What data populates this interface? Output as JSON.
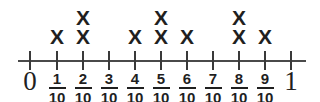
{
  "chart_data": {
    "type": "line-plot",
    "title": "",
    "xlabel": "",
    "ylabel": "",
    "axis": {
      "start_label": "0",
      "end_label": "1",
      "denominator": "10",
      "tick_count": 11,
      "range": [
        0,
        1
      ]
    },
    "categories": [
      "0",
      "1/10",
      "2/10",
      "3/10",
      "4/10",
      "5/10",
      "6/10",
      "7/10",
      "8/10",
      "9/10",
      "1"
    ],
    "values": [
      0,
      1,
      2,
      0,
      1,
      2,
      1,
      0,
      2,
      1,
      0
    ],
    "mark_glyph": "X",
    "ticks": [
      {
        "name": "tick-0",
        "numerator": "0",
        "denominator": "",
        "whole": true,
        "label": "0",
        "x": 30,
        "marks": 0
      },
      {
        "name": "tick-1",
        "numerator": "1",
        "denominator": "10",
        "whole": false,
        "label": "1/10",
        "x": 57,
        "marks": 1
      },
      {
        "name": "tick-2",
        "numerator": "2",
        "denominator": "10",
        "whole": false,
        "label": "2/10",
        "x": 83,
        "marks": 2
      },
      {
        "name": "tick-3",
        "numerator": "3",
        "denominator": "10",
        "whole": false,
        "label": "3/10",
        "x": 109,
        "marks": 0
      },
      {
        "name": "tick-4",
        "numerator": "4",
        "denominator": "10",
        "whole": false,
        "label": "4/10",
        "x": 135,
        "marks": 1
      },
      {
        "name": "tick-5",
        "numerator": "5",
        "denominator": "10",
        "whole": false,
        "label": "5/10",
        "x": 161,
        "marks": 2
      },
      {
        "name": "tick-6",
        "numerator": "6",
        "denominator": "10",
        "whole": false,
        "label": "6/10",
        "x": 187,
        "marks": 1
      },
      {
        "name": "tick-7",
        "numerator": "7",
        "denominator": "10",
        "whole": false,
        "label": "7/10",
        "x": 213,
        "marks": 0
      },
      {
        "name": "tick-8",
        "numerator": "8",
        "denominator": "10",
        "whole": false,
        "label": "8/10",
        "x": 239,
        "marks": 2
      },
      {
        "name": "tick-9",
        "numerator": "9",
        "denominator": "10",
        "whole": false,
        "label": "9/10",
        "x": 265,
        "marks": 1
      },
      {
        "name": "tick-10",
        "numerator": "1",
        "denominator": "",
        "whole": true,
        "label": "1",
        "x": 291,
        "marks": 0
      }
    ],
    "colors": {
      "axis": "#4a4a4a",
      "tick": "#3a3a3a",
      "mark": "#1f1f1f",
      "text": "#1f1f1f",
      "background": "#ffffff"
    }
  }
}
